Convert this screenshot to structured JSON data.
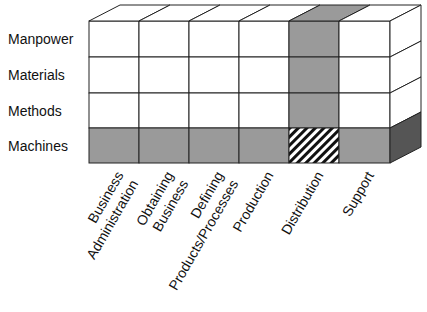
{
  "diagram": {
    "rows": [
      "Manpower",
      "Materials",
      "Methods",
      "Machines"
    ],
    "columns": [
      {
        "lines": [
          "Business",
          "Administration"
        ]
      },
      {
        "lines": [
          "Obtaining",
          "Business"
        ]
      },
      {
        "lines": [
          "Defining",
          "Products/Processes"
        ]
      },
      {
        "lines": [
          "Production"
        ]
      },
      {
        "lines": [
          "Distribution"
        ]
      },
      {
        "lines": [
          "Support"
        ]
      }
    ],
    "highlights": {
      "shaded_row": "Machines",
      "shaded_column": "Distribution",
      "hatched_cell": {
        "row": "Machines",
        "column": "Distribution"
      }
    },
    "colors": {
      "shade": "#9a9a9a",
      "dark_side": "#555555",
      "line": "#222222",
      "fill": "#ffffff"
    }
  }
}
